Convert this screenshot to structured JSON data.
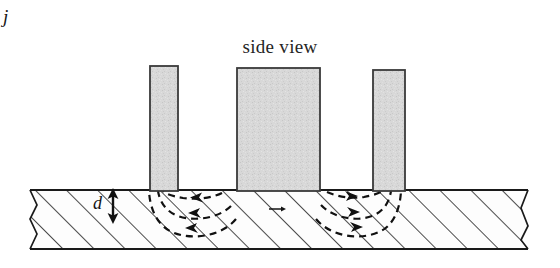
{
  "figure": {
    "title": "side view",
    "view_type": "side view",
    "background_color": "#ffffff",
    "line_color": "#1a1a1a",
    "hatch_color": "#2b2b2b",
    "bar_fill_color": "#d6d6d6",
    "bar_edge_color": "#3a3a3a",
    "flow_line_color": "#111111"
  },
  "labels": {
    "thickness_symbol": "d",
    "current_density_symbol": "j",
    "current_density_has_vector_arrow": true
  },
  "electrodes": [
    {
      "name": "left-electrode",
      "x": 150,
      "y": 66,
      "width": 28,
      "height": 126
    },
    {
      "name": "center-electrode",
      "x": 237,
      "y": 68,
      "width": 83,
      "height": 124
    },
    {
      "name": "right-electrode",
      "x": 373,
      "y": 70,
      "width": 32,
      "height": 122
    }
  ],
  "substrate": {
    "name": "hatched-substrate",
    "top": 190,
    "bottom": 249,
    "left": 30,
    "right": 528,
    "hatch_angle_deg": 45,
    "hatch_spacing": 22,
    "broken_edges": [
      "left",
      "right"
    ]
  },
  "thickness_indicator": {
    "name": "thickness-arrow",
    "x": 113,
    "top": 190,
    "bottom": 222,
    "double_headed": true
  },
  "current_flow": {
    "style": "dashed",
    "left_group_direction": "left",
    "right_group_direction": "right",
    "arcs_per_group": 3,
    "description": "dashed current streamlines arcing from the center electrode outward to the side electrodes"
  }
}
